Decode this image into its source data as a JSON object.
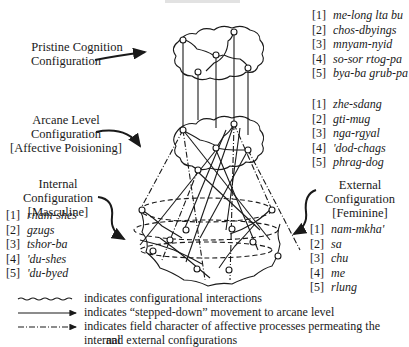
{
  "figure": {
    "title_clipped": ""
  },
  "labels": {
    "pristine": [
      "Pristine Cognition",
      "Configuration"
    ],
    "arcane": [
      "Arcane Level",
      "Configuration",
      "[Affective Poisioning]"
    ],
    "internal": [
      "Internal",
      "Configuration",
      "[Masculine]"
    ],
    "external": [
      "External",
      "Configuration",
      "[Feminine]"
    ]
  },
  "lists": {
    "pristine": [
      {
        "num": "[1]",
        "term": "me-long lta bu"
      },
      {
        "num": "[2]",
        "term": "chos-dbyings"
      },
      {
        "num": "[3]",
        "term": "mnyam-nyid"
      },
      {
        "num": "[4]",
        "term": "so-sor rtog-pa"
      },
      {
        "num": "[5]",
        "term": "bya-ba grub-pa"
      }
    ],
    "arcane": [
      {
        "num": "[1]",
        "term": "zhe-sdang"
      },
      {
        "num": "[2]",
        "term": "gti-mug"
      },
      {
        "num": "[3]",
        "term": "nga-rgyal"
      },
      {
        "num": "[4]",
        "term": "'dod-chags"
      },
      {
        "num": "[5]",
        "term": "phrag-dog"
      }
    ],
    "internal": [
      {
        "num": "[1]",
        "term": "rnam-shes"
      },
      {
        "num": "[2]",
        "term": "gzugs"
      },
      {
        "num": "[3]",
        "term": "tshor-ba"
      },
      {
        "num": "[4]",
        "term": "'du-shes"
      },
      {
        "num": "[5]",
        "term": "'du-byed"
      }
    ],
    "external": [
      {
        "num": "[1]",
        "term": "nam-mkha'"
      },
      {
        "num": "[2]",
        "term": "sa"
      },
      {
        "num": "[3]",
        "term": "chu"
      },
      {
        "num": "[4]",
        "term": "me"
      },
      {
        "num": "[5]",
        "term": "rlung"
      }
    ]
  },
  "legend": [
    {
      "style": "wavy",
      "text": "indicates configurational interactions"
    },
    {
      "style": "solid-arrow",
      "text": "indicates “stepped-down” movement to arcane level"
    },
    {
      "style": "dash-dot-arrow",
      "text": "indicates field character of affective processes permeating the internal"
    },
    {
      "style": "continuation",
      "text": "and external configurations"
    }
  ],
  "colors": {
    "ink": "#1a1a1a",
    "background": "#ffffff"
  }
}
